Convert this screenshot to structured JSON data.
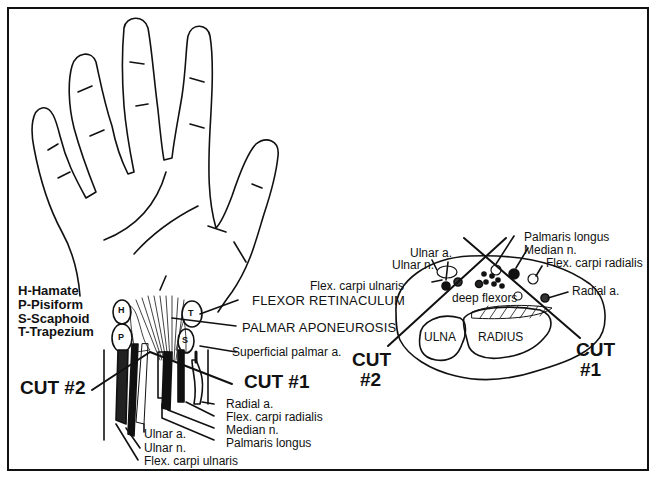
{
  "figure": {
    "colors": {
      "ink": "#111111",
      "background": "#ffffff"
    }
  },
  "legend": {
    "items": [
      {
        "key": "H",
        "label": "H-Hamate"
      },
      {
        "key": "P",
        "label": "P-Pisiform"
      },
      {
        "key": "S",
        "label": "S-Scaphoid"
      },
      {
        "key": "T",
        "label": "T-Trapezium"
      }
    ]
  },
  "bone_markers": {
    "H": "H",
    "P": "P",
    "S": "S",
    "T": "T"
  },
  "hand_labels": {
    "flexor_retinaculum": "FLEXOR RETINACULUM",
    "palmar_aponeurosis": "PALMAR APONEUROSIS",
    "superficial_palmar_a": "Superficial palmar a.",
    "cut1": "CUT #1",
    "cut2": "CUT #2",
    "radial_a": "Radial a.",
    "flex_carpi_radialis": "Flex. carpi radialis",
    "median_n": "Median n.",
    "palmaris_longus": "Palmaris longus",
    "ulnar_a": "Ulnar a.",
    "ulnar_n": "Ulnar n.",
    "flex_carpi_ulnaris": "Flex. carpi ulnaris"
  },
  "section_labels": {
    "palmaris_longus": "Palmaris longus",
    "median_n": "Median n.",
    "flex_carpi_radialis": "Flex. carpi radialis",
    "ulnar_a": "Ulnar a.",
    "ulnar_n": "Ulnar n.",
    "flex_carpi_ulnaris": "Flex. carpi ulnaris",
    "radial_a": "Radial a.",
    "deep_flexors": "deep flexors",
    "ulna": "ULNA",
    "radius": "RADIUS",
    "cut1_line1": "CUT",
    "cut1_line2": "#1",
    "cut2_line1": "CUT",
    "cut2_line2": "#2"
  }
}
